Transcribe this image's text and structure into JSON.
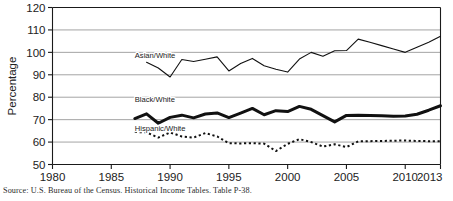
{
  "figure": {
    "source_note": "Source: U.S. Bureau of the Census. Historical Income Tables. Table P-38."
  },
  "chart_data": {
    "type": "line",
    "title": "",
    "xlabel": "",
    "ylabel": "Percentage",
    "xlim": [
      1980,
      2013
    ],
    "ylim": [
      50,
      120
    ],
    "xticks": [
      1980,
      1985,
      1990,
      1995,
      2000,
      2005,
      2010,
      2013
    ],
    "yticks": [
      50,
      60,
      70,
      80,
      90,
      100,
      110,
      120
    ],
    "grid": "horizontal",
    "legend_position": "inline-labels",
    "series": [
      {
        "name": "Asian/White",
        "style": "solid-thin",
        "label_x": 1987,
        "label_y": 97.5,
        "x": [
          1988,
          1989,
          1990,
          1991,
          1992,
          1993,
          1994,
          1995,
          1996,
          1997,
          1998,
          1999,
          2000,
          2001,
          2002,
          2003,
          2004,
          2005,
          2006,
          2007,
          2008,
          2009,
          2010,
          2011,
          2012,
          2013
        ],
        "values": [
          95.6,
          93.0,
          89.0,
          96.8,
          95.9,
          96.9,
          98.0,
          91.7,
          95.0,
          97.3,
          94.0,
          92.5,
          91.2,
          97.0,
          100.0,
          98.3,
          100.7,
          100.8,
          105.9,
          104.5,
          103.0,
          101.5,
          100.0,
          102.3,
          104.5,
          107.2
        ]
      },
      {
        "name": "Black/White",
        "style": "solid-thick",
        "label_x": 1987,
        "label_y": 78.0,
        "x": [
          1987,
          1988,
          1989,
          1990,
          1991,
          1992,
          1993,
          1994,
          1995,
          1996,
          1997,
          1998,
          1999,
          2000,
          2001,
          2002,
          2003,
          2004,
          2005,
          2006,
          2007,
          2008,
          2009,
          2010,
          2011,
          2012,
          2013
        ],
        "values": [
          70.5,
          72.6,
          68.4,
          71.0,
          72.0,
          70.8,
          72.5,
          73.0,
          70.9,
          72.9,
          75.0,
          72.2,
          74.0,
          73.6,
          75.9,
          74.6,
          71.8,
          69.0,
          71.9,
          72.0,
          71.8,
          71.7,
          71.5,
          71.6,
          72.4,
          74.2,
          76.2
        ]
      },
      {
        "name": "Hispanic/White",
        "style": "dotted",
        "label_x": 1987,
        "label_y": 64.8,
        "x": [
          1987,
          1988,
          1989,
          1990,
          1991,
          1992,
          1993,
          1994,
          1995,
          1996,
          1997,
          1998,
          1999,
          2000,
          2001,
          2002,
          2003,
          2004,
          2005,
          2006,
          2007,
          2008,
          2009,
          2010,
          2011,
          2012,
          2013
        ],
        "values": [
          64.5,
          64.3,
          62.0,
          64.3,
          62.5,
          62.0,
          64.0,
          62.5,
          59.5,
          59.4,
          59.5,
          59.3,
          56.0,
          59.2,
          61.3,
          60.0,
          58.0,
          59.0,
          57.8,
          60.3,
          60.4,
          60.5,
          60.6,
          60.7,
          60.5,
          60.4,
          60.4
        ]
      }
    ]
  }
}
